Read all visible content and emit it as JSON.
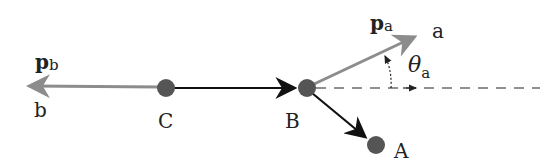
{
  "diagram": {
    "nodes": {
      "A": {
        "label": "A",
        "x": 376,
        "y": 145
      },
      "B": {
        "label": "B",
        "x": 307,
        "y": 88
      },
      "C": {
        "label": "C",
        "x": 166,
        "y": 88
      }
    },
    "endpoints": {
      "a": {
        "label": "a"
      },
      "b": {
        "label": "b"
      }
    },
    "vectors": {
      "pa": {
        "main": "p",
        "sub": "a"
      },
      "pb": {
        "main": "p",
        "sub": "b"
      }
    },
    "angle": {
      "main": "θ",
      "sub": "a"
    },
    "colors": {
      "node": "#555555",
      "black_edge": "#111111",
      "gray_vector": "#8c8c8c",
      "dashed": "#222222"
    }
  }
}
